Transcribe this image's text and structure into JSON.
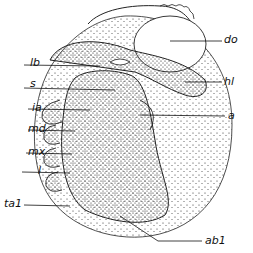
{
  "figure": {
    "labels": [
      {
        "id": "lb",
        "text": "lb",
        "x": 9,
        "y": 43
      },
      {
        "id": "s",
        "text": "s",
        "x": 13,
        "y": 59
      },
      {
        "id": "ia",
        "text": "ia",
        "x": 9,
        "y": 99
      },
      {
        "id": "md",
        "text": "md",
        "x": 6,
        "y": 117
      },
      {
        "id": "mx",
        "text": "mx",
        "x": 4,
        "y": 138
      },
      {
        "id": "l",
        "text": "l",
        "x": 16,
        "y": 158
      },
      {
        "id": "ta1",
        "text": "ta1",
        "x": 4,
        "y": 197
      },
      {
        "id": "do",
        "text": "do",
        "x": 225,
        "y": 33
      },
      {
        "id": "hl",
        "text": "hl",
        "x": 225,
        "y": 74
      },
      {
        "id": "a",
        "text": "a",
        "x": 228,
        "y": 110
      },
      {
        "id": "ab1",
        "text": "ab1",
        "x": 203,
        "y": 236
      }
    ]
  }
}
